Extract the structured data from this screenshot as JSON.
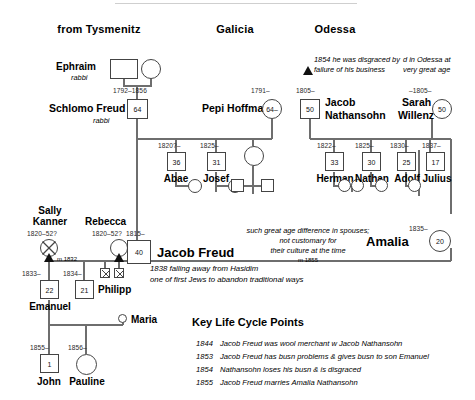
{
  "headers": [
    {
      "label": "from Tysmenitz",
      "x": 99,
      "y": 28
    },
    {
      "label": "Galicia",
      "x": 235,
      "y": 28
    },
    {
      "label": "Odessa",
      "x": 333,
      "y": 28
    }
  ],
  "annotations": {
    "disgrace": [
      "1854 he was disgraced by",
      "failure of his business"
    ],
    "died_odessa": [
      "d in Odessa at",
      "very great age"
    ],
    "age_gap": [
      "such great age difference in spouses;",
      "not customary for",
      "their culture at the time"
    ],
    "age_gap_marriage": "m 1855",
    "hasidim": [
      "1838 falling away from Hasidim",
      "one of first Jews to abandon traditional ways"
    ]
  },
  "people": {
    "ephraim": {
      "name": "Ephraim",
      "role": "rabbi",
      "years": "",
      "age": ""
    },
    "ephraim_wife": {
      "name": "",
      "role": "",
      "years": "",
      "age": ""
    },
    "schlomo": {
      "name": "Schlomo Freud",
      "role": "rabbi",
      "years": "1792–1856",
      "age": "64"
    },
    "pepi": {
      "name": "Pepi Hoffman",
      "role": "",
      "years": "1791–",
      "age": "64–"
    },
    "jacob_nathansohn": {
      "name": "Jacob Nathansohn",
      "name_l1": "Jacob",
      "name_l2": "Nathansohn",
      "role": "",
      "years": "1805–",
      "age": "50"
    },
    "sarah": {
      "name": "Sarah Willenz",
      "name_l1": "Sarah",
      "name_l2": "Willenz",
      "role": "",
      "years": "–1805–",
      "age": "50"
    },
    "abae": {
      "name": "Abae",
      "years": "1820?–",
      "age": "36"
    },
    "josef": {
      "name": "Josef",
      "years": "1825–",
      "age": "31"
    },
    "herman": {
      "name": "Herman",
      "years": "1822–",
      "age": "33"
    },
    "nathan": {
      "name": "Nathan",
      "years": "1825–",
      "age": "30"
    },
    "adolf": {
      "name": "Adolf",
      "years": "1830–",
      "age": "25"
    },
    "julius": {
      "name": "Julius",
      "years": "1837–",
      "age": "17"
    },
    "sally": {
      "name_l1": "Sally",
      "name_l2": "Kanner",
      "years": "1820–52?",
      "age": ""
    },
    "rebecca": {
      "name": "Rebecca",
      "years": "1820–52?",
      "age": ""
    },
    "jacob_freud": {
      "name": "Jacob Freud",
      "years": "1815–",
      "age": "40"
    },
    "amalia": {
      "name": "Amalia",
      "years": "1835–",
      "age": "20"
    },
    "emanuel": {
      "name": "Emanuel",
      "years": "1833–",
      "age": "22"
    },
    "philipp": {
      "name": "Philipp",
      "years": "1834–",
      "age": "21"
    },
    "maria": {
      "name": "Maria",
      "years": "",
      "age": ""
    },
    "john": {
      "name": "John",
      "years": "1855–",
      "age": "1"
    },
    "pauline": {
      "name": "Pauline",
      "years": "1856–",
      "age": ""
    }
  },
  "marriages": {
    "sally_m": "m 1832",
    "rebecca_m": "m 52"
  },
  "key_panel": {
    "title": "Key Life Cycle Points",
    "entries": [
      {
        "year": "1844",
        "text": "Jacob Freud was wool merchant w Jacob Nathansohn"
      },
      {
        "year": "1853",
        "text": "Jacob Freud has busn problems & gives busn to son Emanuel"
      },
      {
        "year": "1854",
        "text": "Nathansohn loses his busn & is disgraced"
      },
      {
        "year": "1855",
        "text": "Jacob Freud marries Amalia Nathansohn"
      }
    ]
  },
  "colors": {
    "line": "#6e6e6e",
    "symbol_stroke": "#444444",
    "text": "#000000",
    "triangle": "#111111"
  }
}
